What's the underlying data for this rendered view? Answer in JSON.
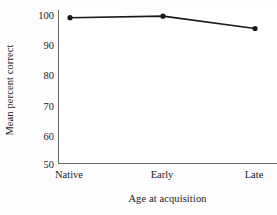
{
  "chart_data": {
    "type": "line",
    "title": "",
    "subtitle": "",
    "xlabel": "Age at acquisition",
    "ylabel": "Mean percent correct",
    "categories": [
      "Native",
      "Early",
      "Late"
    ],
    "values": [
      97.5,
      98.0,
      94.0
    ],
    "series": [
      {
        "name": "Mean percent correct",
        "values": [
          97.5,
          98.0,
          94.0
        ]
      }
    ],
    "ylim": [
      50,
      100
    ],
    "yticks": [
      50,
      60,
      70,
      80,
      90,
      100
    ],
    "ytick_labels": [
      "50",
      "60",
      "70",
      "80",
      "90",
      "100"
    ],
    "xtick_labels": [
      "Native",
      "Early",
      "Late"
    ],
    "grid": false,
    "legend": false,
    "legend_position": "none",
    "marker": "filled-circle",
    "line_color": "#1a1a1a",
    "marker_color": "#1a1a1a",
    "axis_color": "#6b6b6b",
    "background_color": "#ffffff"
  }
}
